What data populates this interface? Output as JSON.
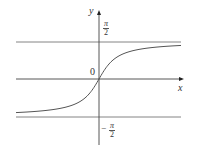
{
  "chart_data": {
    "type": "line",
    "title": "",
    "function": "y = arctan(x)",
    "xlabel": "x",
    "ylabel": "y",
    "origin_label": "0",
    "y_tick_labels": [
      {
        "value": 1.5708,
        "label_num": "π",
        "label_den": "2",
        "sign": ""
      },
      {
        "value": -1.5708,
        "label_num": "π",
        "label_den": "2",
        "sign": "−"
      }
    ],
    "asymptotes": [
      {
        "y": 1.5708,
        "label": "π/2"
      },
      {
        "y": -1.5708,
        "label": "−π/2"
      }
    ],
    "xlim": [
      -6,
      6
    ],
    "ylim": [
      -2,
      2
    ],
    "grid": false,
    "series": [
      {
        "name": "arctan",
        "x": [
          -6,
          -5,
          -4,
          -3,
          -2,
          -1,
          -0.5,
          0,
          0.5,
          1,
          2,
          3,
          4,
          5,
          6
        ],
        "y": [
          -1.406,
          -1.373,
          -1.326,
          -1.249,
          -1.107,
          -0.785,
          -0.464,
          0,
          0.464,
          0.785,
          1.107,
          1.249,
          1.326,
          1.373,
          1.406
        ]
      }
    ]
  },
  "labels": {
    "y_axis": "y",
    "x_axis": "x",
    "origin": "0",
    "pi": "π",
    "two": "2",
    "minus": "−"
  }
}
